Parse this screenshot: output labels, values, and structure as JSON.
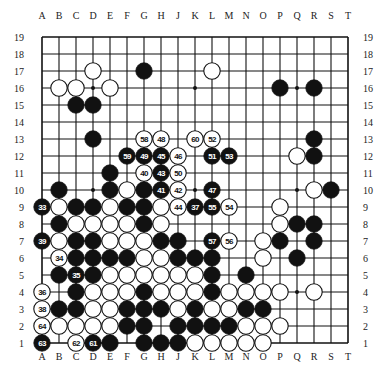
{
  "board": {
    "size": 19,
    "columns": [
      "A",
      "B",
      "C",
      "D",
      "E",
      "F",
      "G",
      "H",
      "J",
      "K",
      "L",
      "M",
      "N",
      "O",
      "P",
      "Q",
      "R",
      "S",
      "T"
    ],
    "rows": [
      "19",
      "18",
      "17",
      "16",
      "15",
      "14",
      "13",
      "12",
      "11",
      "10",
      "9",
      "8",
      "7",
      "6",
      "5",
      "4",
      "3",
      "2",
      "1"
    ],
    "star_points": [
      "D16",
      "K16",
      "Q16",
      "D10",
      "K10",
      "Q10",
      "D4",
      "K4",
      "Q4"
    ],
    "colors": {
      "line": "#111111",
      "black_stone": "#111111",
      "white_stone": "#ffffff",
      "background": "#ffffff"
    }
  },
  "stones": [
    {
      "pos": "D17",
      "color": "white"
    },
    {
      "pos": "G17",
      "color": "black"
    },
    {
      "pos": "L17",
      "color": "white"
    },
    {
      "pos": "B16",
      "color": "white"
    },
    {
      "pos": "C16",
      "color": "white"
    },
    {
      "pos": "E16",
      "color": "white"
    },
    {
      "pos": "P16",
      "color": "black"
    },
    {
      "pos": "R16",
      "color": "black"
    },
    {
      "pos": "C15",
      "color": "black"
    },
    {
      "pos": "D15",
      "color": "black"
    },
    {
      "pos": "D13",
      "color": "black"
    },
    {
      "pos": "G13",
      "color": "white",
      "label": "58"
    },
    {
      "pos": "H13",
      "color": "white",
      "label": "48"
    },
    {
      "pos": "K13",
      "color": "white",
      "label": "60"
    },
    {
      "pos": "L13",
      "color": "white",
      "label": "52"
    },
    {
      "pos": "R13",
      "color": "black"
    },
    {
      "pos": "F12",
      "color": "black",
      "label": "59"
    },
    {
      "pos": "G12",
      "color": "black",
      "label": "49"
    },
    {
      "pos": "H12",
      "color": "black",
      "label": "45"
    },
    {
      "pos": "J12",
      "color": "white",
      "label": "46"
    },
    {
      "pos": "L12",
      "color": "black",
      "label": "51"
    },
    {
      "pos": "M12",
      "color": "black",
      "label": "53"
    },
    {
      "pos": "Q12",
      "color": "white"
    },
    {
      "pos": "R12",
      "color": "black"
    },
    {
      "pos": "E11",
      "color": "black"
    },
    {
      "pos": "G11",
      "color": "white",
      "label": "40"
    },
    {
      "pos": "H11",
      "color": "black",
      "label": "43"
    },
    {
      "pos": "J11",
      "color": "white",
      "label": "50"
    },
    {
      "pos": "B10",
      "color": "black"
    },
    {
      "pos": "E10",
      "color": "black"
    },
    {
      "pos": "F10",
      "color": "white"
    },
    {
      "pos": "G10",
      "color": "black"
    },
    {
      "pos": "H10",
      "color": "black",
      "label": "41"
    },
    {
      "pos": "J10",
      "color": "white",
      "label": "42"
    },
    {
      "pos": "L10",
      "color": "black",
      "label": "47"
    },
    {
      "pos": "R10",
      "color": "white"
    },
    {
      "pos": "S10",
      "color": "black"
    },
    {
      "pos": "A9",
      "color": "black",
      "label": "33"
    },
    {
      "pos": "B9",
      "color": "white"
    },
    {
      "pos": "C9",
      "color": "black"
    },
    {
      "pos": "D9",
      "color": "black"
    },
    {
      "pos": "E9",
      "color": "white"
    },
    {
      "pos": "F9",
      "color": "black"
    },
    {
      "pos": "G9",
      "color": "black"
    },
    {
      "pos": "H9",
      "color": "white"
    },
    {
      "pos": "J9",
      "color": "white",
      "label": "44"
    },
    {
      "pos": "K9",
      "color": "black",
      "label": "37"
    },
    {
      "pos": "L9",
      "color": "black",
      "label": "55"
    },
    {
      "pos": "M9",
      "color": "white",
      "label": "54"
    },
    {
      "pos": "P9",
      "color": "white"
    },
    {
      "pos": "B8",
      "color": "black"
    },
    {
      "pos": "C8",
      "color": "white"
    },
    {
      "pos": "D8",
      "color": "white"
    },
    {
      "pos": "E8",
      "color": "white"
    },
    {
      "pos": "F8",
      "color": "white"
    },
    {
      "pos": "G8",
      "color": "black"
    },
    {
      "pos": "H8",
      "color": "white"
    },
    {
      "pos": "P8",
      "color": "white"
    },
    {
      "pos": "Q8",
      "color": "black"
    },
    {
      "pos": "R8",
      "color": "black"
    },
    {
      "pos": "A7",
      "color": "black",
      "label": "39"
    },
    {
      "pos": "B7",
      "color": "white"
    },
    {
      "pos": "C7",
      "color": "black"
    },
    {
      "pos": "D7",
      "color": "black"
    },
    {
      "pos": "E7",
      "color": "white"
    },
    {
      "pos": "F7",
      "color": "white"
    },
    {
      "pos": "G7",
      "color": "white"
    },
    {
      "pos": "H7",
      "color": "black"
    },
    {
      "pos": "J7",
      "color": "black"
    },
    {
      "pos": "L7",
      "color": "black",
      "label": "57"
    },
    {
      "pos": "M7",
      "color": "white",
      "label": "56"
    },
    {
      "pos": "O7",
      "color": "white"
    },
    {
      "pos": "P7",
      "color": "black"
    },
    {
      "pos": "R7",
      "color": "black"
    },
    {
      "pos": "B6",
      "color": "white",
      "label": "34"
    },
    {
      "pos": "C6",
      "color": "black"
    },
    {
      "pos": "D6",
      "color": "black"
    },
    {
      "pos": "E6",
      "color": "black"
    },
    {
      "pos": "F6",
      "color": "black"
    },
    {
      "pos": "G6",
      "color": "white"
    },
    {
      "pos": "H6",
      "color": "white"
    },
    {
      "pos": "J6",
      "color": "black"
    },
    {
      "pos": "K6",
      "color": "black"
    },
    {
      "pos": "L6",
      "color": "black"
    },
    {
      "pos": "O6",
      "color": "white"
    },
    {
      "pos": "Q6",
      "color": "black"
    },
    {
      "pos": "B5",
      "color": "black"
    },
    {
      "pos": "C5",
      "color": "black",
      "label": "35"
    },
    {
      "pos": "D5",
      "color": "black"
    },
    {
      "pos": "E5",
      "color": "white"
    },
    {
      "pos": "F5",
      "color": "white"
    },
    {
      "pos": "G5",
      "color": "white"
    },
    {
      "pos": "H5",
      "color": "white"
    },
    {
      "pos": "J5",
      "color": "white"
    },
    {
      "pos": "K5",
      "color": "white"
    },
    {
      "pos": "L5",
      "color": "black"
    },
    {
      "pos": "N5",
      "color": "black"
    },
    {
      "pos": "A4",
      "color": "white",
      "label": "36"
    },
    {
      "pos": "C4",
      "color": "black"
    },
    {
      "pos": "D4",
      "color": "white"
    },
    {
      "pos": "E4",
      "color": "white"
    },
    {
      "pos": "F4",
      "color": "white"
    },
    {
      "pos": "G4",
      "color": "black"
    },
    {
      "pos": "H4",
      "color": "white"
    },
    {
      "pos": "J4",
      "color": "white"
    },
    {
      "pos": "K4",
      "color": "white"
    },
    {
      "pos": "L4",
      "color": "black"
    },
    {
      "pos": "M4",
      "color": "white"
    },
    {
      "pos": "N4",
      "color": "white"
    },
    {
      "pos": "O4",
      "color": "white"
    },
    {
      "pos": "P4",
      "color": "white"
    },
    {
      "pos": "R4",
      "color": "white"
    },
    {
      "pos": "A3",
      "color": "white",
      "label": "38"
    },
    {
      "pos": "B3",
      "color": "black"
    },
    {
      "pos": "C3",
      "color": "black"
    },
    {
      "pos": "D3",
      "color": "white"
    },
    {
      "pos": "E3",
      "color": "white"
    },
    {
      "pos": "F3",
      "color": "black"
    },
    {
      "pos": "G3",
      "color": "black"
    },
    {
      "pos": "H3",
      "color": "black"
    },
    {
      "pos": "J3",
      "color": "white"
    },
    {
      "pos": "K3",
      "color": "black"
    },
    {
      "pos": "L3",
      "color": "white"
    },
    {
      "pos": "M3",
      "color": "white"
    },
    {
      "pos": "N3",
      "color": "black"
    },
    {
      "pos": "O3",
      "color": "black"
    },
    {
      "pos": "A2",
      "color": "white",
      "label": "64"
    },
    {
      "pos": "B2",
      "color": "white"
    },
    {
      "pos": "C2",
      "color": "white"
    },
    {
      "pos": "D2",
      "color": "white"
    },
    {
      "pos": "E2",
      "color": "white"
    },
    {
      "pos": "F2",
      "color": "black"
    },
    {
      "pos": "G2",
      "color": "black"
    },
    {
      "pos": "J2",
      "color": "black"
    },
    {
      "pos": "K2",
      "color": "black"
    },
    {
      "pos": "L2",
      "color": "black"
    },
    {
      "pos": "M2",
      "color": "black"
    },
    {
      "pos": "N2",
      "color": "white"
    },
    {
      "pos": "O2",
      "color": "white"
    },
    {
      "pos": "P2",
      "color": "white"
    },
    {
      "pos": "A1",
      "color": "black",
      "label": "63"
    },
    {
      "pos": "C1",
      "color": "white",
      "label": "62"
    },
    {
      "pos": "D1",
      "color": "black",
      "label": "61"
    },
    {
      "pos": "E1",
      "color": "black"
    },
    {
      "pos": "G1",
      "color": "black"
    },
    {
      "pos": "H1",
      "color": "black"
    },
    {
      "pos": "J1",
      "color": "black"
    },
    {
      "pos": "K1",
      "color": "white"
    },
    {
      "pos": "L1",
      "color": "white"
    },
    {
      "pos": "M1",
      "color": "white"
    },
    {
      "pos": "N1",
      "color": "white"
    },
    {
      "pos": "O1",
      "color": "white"
    }
  ]
}
